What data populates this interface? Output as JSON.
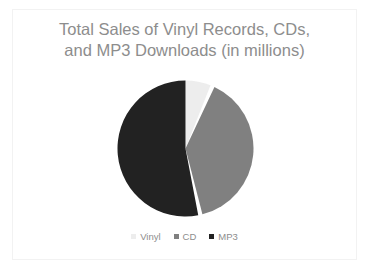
{
  "slide": {
    "background_color": "#ffffff",
    "frame_color": "#f2f2f2"
  },
  "chart_data": {
    "type": "pie",
    "title": "Total Sales of Vinyl Records, CDs,\nand MP3 Downloads (in millions)",
    "title_line_1": "Total Sales of Vinyl Records, CDs,",
    "title_line_2": "and MP3 Downloads (in millions)",
    "title_color": "#8d8d8d",
    "xlabel": "",
    "ylabel": "",
    "legend_position": "bottom",
    "grid": false,
    "labels": [
      "Vinyl",
      "CD",
      "MP3"
    ],
    "values": [
      6,
      39,
      55
    ],
    "percentages": [
      6,
      39,
      55
    ],
    "colors": [
      "#ededed",
      "#808080",
      "#222222"
    ],
    "start_angle_deg": 0,
    "direction": "clockwise",
    "slices": [
      {
        "label": "Vinyl",
        "value": 6,
        "percent": 6,
        "color": "#ededed",
        "start_deg": 0,
        "end_deg": 21.6
      },
      {
        "label": "CD",
        "value": 39,
        "percent": 39,
        "color": "#808080",
        "start_deg": 25.2,
        "end_deg": 165.6
      },
      {
        "label": "MP3",
        "value": 55,
        "percent": 55,
        "color": "#222222",
        "start_deg": 169.2,
        "end_deg": 360
      }
    ]
  },
  "legend": {
    "items": [
      {
        "label": "Vinyl",
        "color": "#ededed",
        "marker": "square-swatch"
      },
      {
        "label": "CD",
        "color": "#808080",
        "marker": "square-swatch"
      },
      {
        "label": "MP3",
        "color": "#222222",
        "marker": "square-swatch"
      }
    ]
  }
}
